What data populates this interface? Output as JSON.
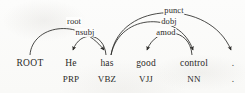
{
  "figure": {
    "ink_color": "#2b2a28",
    "background_color": "#fdfdfc"
  },
  "tokens": [
    {
      "id": "root",
      "word": "ROOT",
      "tag": "",
      "x": 30,
      "word_y": 64,
      "tag_y": 79
    },
    {
      "id": "he",
      "word": "He",
      "tag": "PRP",
      "x": 71,
      "word_y": 64,
      "tag_y": 79
    },
    {
      "id": "has",
      "word": "has",
      "tag": "VBZ",
      "x": 107,
      "word_y": 64,
      "tag_y": 79
    },
    {
      "id": "good",
      "word": "good",
      "tag": "VJJ",
      "x": 146,
      "word_y": 64,
      "tag_y": 79
    },
    {
      "id": "control",
      "word": "control",
      "tag": "NN",
      "x": 194,
      "word_y": 64,
      "tag_y": 79
    },
    {
      "id": "period",
      "word": ".",
      "tag": ".",
      "x": 233,
      "word_y": 64,
      "tag_y": 79
    }
  ],
  "arcs": [
    {
      "id": "arc-root",
      "label": "root",
      "head": "ROOT",
      "dependent": "has",
      "label_x": 74,
      "label_y": 17
    },
    {
      "id": "arc-nsubj",
      "label": "nsubj",
      "head": "has",
      "dependent": "He",
      "label_x": 85,
      "label_y": 28
    },
    {
      "id": "arc-punct",
      "label": "punct",
      "head": "has",
      "dependent": ".",
      "label_x": 174,
      "label_y": 6
    },
    {
      "id": "arc-dobj",
      "label": "dobj",
      "head": "has",
      "dependent": "control",
      "label_x": 169,
      "label_y": 17
    },
    {
      "id": "arc-amod",
      "label": "amod",
      "head": "control",
      "dependent": "good",
      "label_x": 166,
      "label_y": 28
    }
  ],
  "sentence": "He has good control ."
}
